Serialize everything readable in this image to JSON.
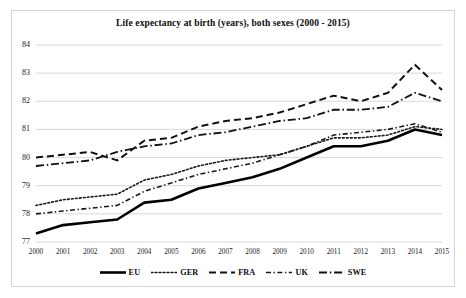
{
  "figure": {
    "title": "Life expectancy at birth (years), both sexes (2000 - 2015)",
    "background_color": "#ffffff",
    "frame_color": "#d5d5d5",
    "gridline_color": "#d9d9d9"
  },
  "axes": {
    "y_tick_labels": [
      "84",
      "83",
      "82",
      "81",
      "80",
      "79",
      "78",
      "77"
    ],
    "x_tick_labels": [
      "2000",
      "2001",
      "2002",
      "2003",
      "2004",
      "2005",
      "2006",
      "2007",
      "2008",
      "2009",
      "2010",
      "2011",
      "2012",
      "2013",
      "2014",
      "2015"
    ]
  },
  "legend": {
    "items": [
      {
        "label": "EU",
        "style": "solid",
        "color": "#000000",
        "width": 2.6
      },
      {
        "label": "GER",
        "style": "dotted",
        "color": "#1a1a1a",
        "width": 1.6
      },
      {
        "label": "FRA",
        "style": "dashed",
        "color": "#111111",
        "width": 2.0
      },
      {
        "label": "UK",
        "style": "dashdot",
        "color": "#1a1a1a",
        "width": 1.5
      },
      {
        "label": "SWE",
        "style": "longdashdot",
        "color": "#111111",
        "width": 1.8
      }
    ]
  },
  "chart_data": {
    "type": "line",
    "title": "Life expectancy at birth (years), both sexes (2000 - 2015)",
    "xlabel": "",
    "ylabel": "",
    "x": [
      2000,
      2001,
      2002,
      2003,
      2004,
      2005,
      2006,
      2007,
      2008,
      2009,
      2010,
      2011,
      2012,
      2013,
      2014,
      2015
    ],
    "categories": [
      "2000",
      "2001",
      "2002",
      "2003",
      "2004",
      "2005",
      "2006",
      "2007",
      "2008",
      "2009",
      "2010",
      "2011",
      "2012",
      "2013",
      "2014",
      "2015"
    ],
    "ylim": [
      77,
      84
    ],
    "xlim": [
      2000,
      2015
    ],
    "grid": true,
    "legend_position": "bottom",
    "series": [
      {
        "name": "EU",
        "style": "solid",
        "color": "#000000",
        "values": [
          77.3,
          77.6,
          77.7,
          77.8,
          78.4,
          78.5,
          78.9,
          79.1,
          79.3,
          79.6,
          80.0,
          80.4,
          80.4,
          80.6,
          81.0,
          80.8
        ]
      },
      {
        "name": "GER",
        "style": "dotted",
        "color": "#1a1a1a",
        "values": [
          78.3,
          78.5,
          78.6,
          78.7,
          79.2,
          79.4,
          79.7,
          79.9,
          80.0,
          80.1,
          80.4,
          80.7,
          80.7,
          80.8,
          81.1,
          81.0
        ]
      },
      {
        "name": "FRA",
        "style": "dashed",
        "color": "#111111",
        "values": [
          80.0,
          80.1,
          80.2,
          79.9,
          80.6,
          80.7,
          81.1,
          81.3,
          81.4,
          81.6,
          81.9,
          82.2,
          82.0,
          82.3,
          83.3,
          82.4
        ]
      },
      {
        "name": "UK",
        "style": "dashdot",
        "color": "#1a1a1a",
        "values": [
          78.0,
          78.1,
          78.2,
          78.3,
          78.8,
          79.1,
          79.4,
          79.6,
          79.8,
          80.1,
          80.4,
          80.8,
          80.9,
          81.0,
          81.2,
          80.9
        ]
      },
      {
        "name": "SWE",
        "style": "longdashdot",
        "color": "#111111",
        "values": [
          79.7,
          79.8,
          79.9,
          80.2,
          80.4,
          80.5,
          80.8,
          80.9,
          81.1,
          81.3,
          81.4,
          81.7,
          81.7,
          81.8,
          82.3,
          82.0
        ]
      }
    ]
  }
}
